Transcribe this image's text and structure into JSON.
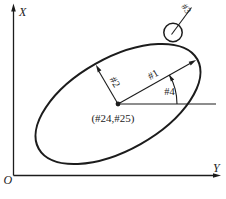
{
  "figure": {
    "type": "engineering-diagram",
    "axes": {
      "x_label": "X",
      "y_label": "Y",
      "origin_label": "O"
    },
    "annotations": {
      "semi_major_label": "#1",
      "semi_minor_label": "#2",
      "circle_label": "#3",
      "angle_label": "#4",
      "center_label": "(#24,#25)"
    },
    "colors": {
      "line": "#1c1c1c",
      "background": "#ffffff"
    }
  }
}
